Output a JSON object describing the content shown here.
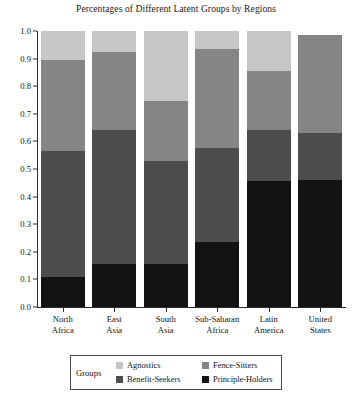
{
  "chart_data": {
    "type": "bar",
    "subtype": "stacked-bar-100-percent",
    "title": "Percentages of Different Latent Groups by Regions",
    "xlabel": "",
    "ylabel": "",
    "ylim": [
      0.0,
      1.0
    ],
    "grid": false,
    "legend_position": "bottom",
    "legend_title": "Groups",
    "ytick_labels": [
      "0.0",
      "0.1",
      "0.2",
      "0.3",
      "0.4",
      "0.5",
      "0.6",
      "0.7",
      "0.8",
      "0.9",
      "1.0"
    ],
    "ytick_values": [
      0.0,
      0.1,
      0.2,
      0.3,
      0.4,
      0.5,
      0.6,
      0.7,
      0.8,
      0.9,
      1.0
    ],
    "categories": [
      "North Africa",
      "East Asia",
      "South Asia",
      "Sub-Saharan Africa",
      "Latin America",
      "United States"
    ],
    "category_lines": [
      [
        "North",
        "Africa"
      ],
      [
        "East",
        "Asia"
      ],
      [
        "South",
        "Asia"
      ],
      [
        "Sub-Saharan",
        "Africa"
      ],
      [
        "Latin",
        "America"
      ],
      [
        "United",
        "States"
      ]
    ],
    "stack_order_bottom_to_top": [
      "Principle-Holders",
      "Benefit-Seekers",
      "Fence-Sitters",
      "Agnostics"
    ],
    "series": [
      {
        "name": "Principle-Holders",
        "color": "#131313",
        "values": [
          0.11,
          0.155,
          0.155,
          0.235,
          0.455,
          0.46
        ]
      },
      {
        "name": "Benefit-Seekers",
        "color": "#4d4d4d",
        "values": [
          0.455,
          0.485,
          0.375,
          0.34,
          0.185,
          0.17
        ]
      },
      {
        "name": "Fence-Sitters",
        "color": "#858585",
        "values": [
          0.33,
          0.285,
          0.215,
          0.36,
          0.215,
          0.355
        ]
      },
      {
        "name": "Agnostics",
        "color": "#c6c6c6",
        "values": [
          0.105,
          0.075,
          0.255,
          0.065,
          0.145,
          0.0
        ]
      }
    ],
    "cumulative_tops": {
      "North Africa": [
        0.11,
        0.565,
        0.895,
        1.0
      ],
      "East Asia": [
        0.155,
        0.64,
        0.925,
        1.0
      ],
      "South Asia": [
        0.155,
        0.53,
        0.745,
        1.0
      ],
      "Sub-Saharan Africa": [
        0.235,
        0.575,
        0.935,
        1.0
      ],
      "Latin America": [
        0.455,
        0.64,
        0.855,
        1.0
      ],
      "United States": [
        0.46,
        0.63,
        0.985,
        0.985
      ]
    }
  },
  "legend": {
    "title": "Groups",
    "entries": [
      {
        "label": "Agnostics",
        "color": "#c6c6c6"
      },
      {
        "label": "Fence-Sitters",
        "color": "#858585"
      },
      {
        "label": "Benefit-Seekers",
        "color": "#4d4d4d"
      },
      {
        "label": "Principle-Holders",
        "color": "#131313"
      }
    ]
  }
}
